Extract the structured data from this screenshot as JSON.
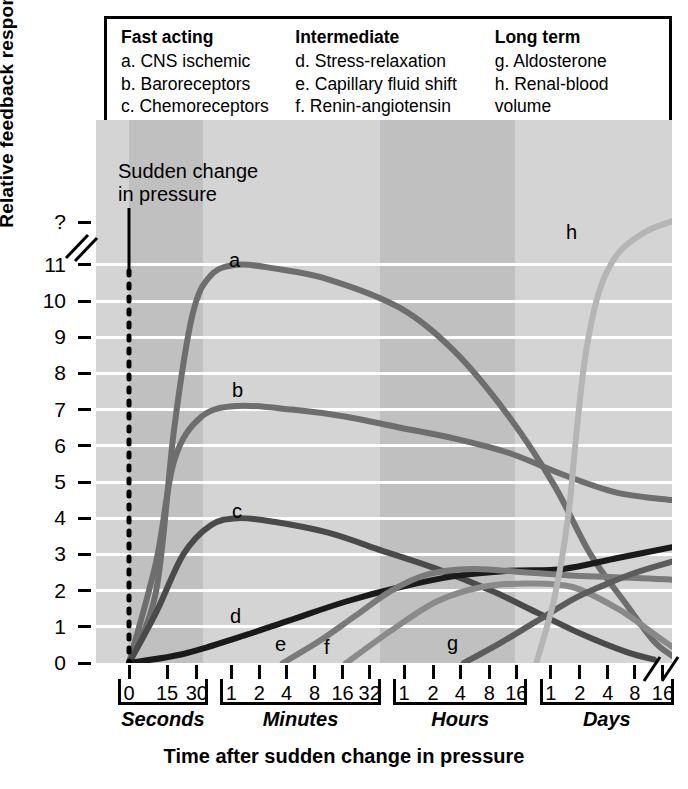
{
  "legend": {
    "columns": [
      {
        "heading": "Fast acting",
        "items": [
          "a. CNS ischemic",
          "b. Baroreceptors",
          "c. Chemoreceptors"
        ]
      },
      {
        "heading": "Intermediate",
        "items": [
          "d. Stress-relaxation",
          "e. Capillary fluid shift",
          "f. Renin-angiotensin"
        ],
        "continuation": "vasoconstriction"
      },
      {
        "heading": "Long term",
        "items": [
          "g. Aldosterone",
          "h. Renal-blood volume"
        ],
        "continuation": "pressure control"
      }
    ]
  },
  "annotations": {
    "sudden_change": "Sudden change\nin pressure"
  },
  "chart_data": {
    "type": "line",
    "title": "",
    "xlabel": "Time after sudden change in pressure",
    "ylabel": "Relative feedback response",
    "ylim": [
      0,
      11
    ],
    "ytick_labels": [
      "?",
      "11",
      "10",
      "9",
      "8",
      "7",
      "6",
      "5",
      "4",
      "3",
      "2",
      "1",
      "0"
    ],
    "grid": true,
    "legend_position": "top",
    "axis_break_y": true,
    "axis_break_x": true,
    "x_groups": [
      {
        "name": "Seconds",
        "ticks": [
          "0",
          "15",
          "30"
        ],
        "shaded": true
      },
      {
        "name": "Minutes",
        "ticks": [
          "1",
          "2",
          "4",
          "8",
          "16",
          "32"
        ],
        "shaded": false
      },
      {
        "name": "Hours",
        "ticks": [
          "1",
          "2",
          "4",
          "8",
          "16"
        ],
        "shaded": true
      },
      {
        "name": "Days",
        "ticks": [
          "1",
          "2",
          "4",
          "8",
          "16"
        ],
        "shaded": false
      }
    ],
    "series": [
      {
        "name": "a",
        "label": "a",
        "description": "CNS ischemic",
        "color": "#6e6e6e",
        "peak_value": 11,
        "peak_time": "30 seconds",
        "points": [
          [
            0,
            0
          ],
          [
            3,
            2.0
          ],
          [
            5,
            6.5
          ],
          [
            7,
            9.6
          ],
          [
            9,
            10.7
          ],
          [
            12,
            11.0
          ],
          [
            16,
            10.9
          ],
          [
            22,
            10.6
          ],
          [
            30,
            9.8
          ],
          [
            36,
            8.6
          ],
          [
            42,
            6.8
          ],
          [
            47,
            4.9
          ],
          [
            51,
            3.0
          ],
          [
            55,
            1.6
          ],
          [
            58,
            0.6
          ],
          [
            60,
            0.2
          ]
        ]
      },
      {
        "name": "b",
        "label": "b",
        "description": "Baroreceptors",
        "color": "#6e6e6e",
        "peak_value": 7.1,
        "peak_time": "1 minute",
        "points": [
          [
            0,
            0
          ],
          [
            3,
            2.8
          ],
          [
            5,
            5.6
          ],
          [
            8,
            6.8
          ],
          [
            12,
            7.1
          ],
          [
            18,
            7.0
          ],
          [
            24,
            6.8
          ],
          [
            30,
            6.5
          ],
          [
            36,
            6.2
          ],
          [
            42,
            5.8
          ],
          [
            48,
            5.2
          ],
          [
            54,
            4.7
          ],
          [
            60,
            4.5
          ]
        ]
      },
      {
        "name": "c",
        "label": "c",
        "description": "Chemoreceptors",
        "color": "#4a4a4a",
        "peak_value": 4.0,
        "peak_time": "1-2 minutes",
        "points": [
          [
            0,
            0
          ],
          [
            3,
            1.4
          ],
          [
            6,
            3.0
          ],
          [
            9,
            3.8
          ],
          [
            12,
            4.0
          ],
          [
            16,
            3.9
          ],
          [
            22,
            3.6
          ],
          [
            28,
            3.1
          ],
          [
            34,
            2.6
          ],
          [
            40,
            2.0
          ],
          [
            45,
            1.4
          ],
          [
            50,
            0.8
          ],
          [
            55,
            0.3
          ],
          [
            58,
            0.1
          ]
        ]
      },
      {
        "name": "d",
        "label": "d",
        "description": "Stress-relaxation",
        "color": "#1a1a1a",
        "peak_value": 3.2,
        "peak_time": "16 days",
        "points": [
          [
            0,
            0
          ],
          [
            6,
            0.25
          ],
          [
            12,
            0.7
          ],
          [
            18,
            1.2
          ],
          [
            24,
            1.7
          ],
          [
            30,
            2.1
          ],
          [
            36,
            2.4
          ],
          [
            42,
            2.55
          ],
          [
            48,
            2.6
          ],
          [
            54,
            2.9
          ],
          [
            60,
            3.2
          ]
        ]
      },
      {
        "name": "e",
        "label": "e",
        "description": "Capillary fluid shift",
        "color": "#7a7a7a",
        "peak_value": 2.6,
        "peak_time": "8-16 hours",
        "points": [
          [
            17,
            0
          ],
          [
            21,
            0.6
          ],
          [
            25,
            1.3
          ],
          [
            29,
            2.0
          ],
          [
            33,
            2.45
          ],
          [
            38,
            2.6
          ],
          [
            44,
            2.5
          ],
          [
            50,
            2.4
          ],
          [
            56,
            2.35
          ],
          [
            60,
            2.3
          ]
        ]
      },
      {
        "name": "f",
        "label": "f",
        "description": "Renin-angiotensin vasoconstriction",
        "color": "#8a8a8a",
        "peak_value": 2.2,
        "peak_time": "2-4 hours",
        "points": [
          [
            24,
            0
          ],
          [
            29,
            0.9
          ],
          [
            34,
            1.7
          ],
          [
            39,
            2.1
          ],
          [
            44,
            2.2
          ],
          [
            49,
            2.1
          ],
          [
            54,
            1.5
          ],
          [
            58,
            0.8
          ],
          [
            60,
            0.45
          ]
        ]
      },
      {
        "name": "g",
        "label": "g",
        "description": "Aldosterone",
        "color": "#5c5c5c",
        "peak_value": 2.8,
        "peak_time": "16 days",
        "points": [
          [
            37,
            0
          ],
          [
            41,
            0.55
          ],
          [
            45,
            1.15
          ],
          [
            49,
            1.75
          ],
          [
            52,
            2.1
          ],
          [
            56,
            2.5
          ],
          [
            60,
            2.8
          ]
        ]
      },
      {
        "name": "h",
        "label": "h",
        "description": "Renal-blood volume pressure control",
        "color": "#b5b5b5",
        "peak_value": "off-scale (?)",
        "peak_time": "2+ days",
        "points": [
          [
            45,
            0
          ],
          [
            47,
            1.8
          ],
          [
            48.5,
            4.0
          ],
          [
            49.5,
            6.5
          ],
          [
            50.5,
            8.6
          ],
          [
            52,
            10.3
          ],
          [
            54,
            11.3
          ],
          [
            57,
            11.9
          ],
          [
            60,
            12.2
          ]
        ]
      }
    ]
  }
}
